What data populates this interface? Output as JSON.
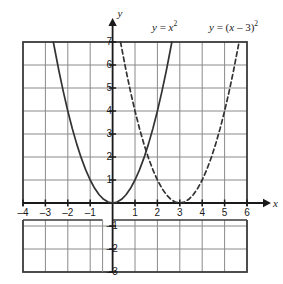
{
  "chart_data": {
    "type": "line",
    "title": "",
    "xlabel": "x",
    "ylabel": "y",
    "xlim": [
      -4,
      6
    ],
    "ylim": [
      -3,
      7
    ],
    "grid": true,
    "legend_position": "top",
    "x_ticks": [
      -4,
      -3,
      -2,
      -1,
      1,
      2,
      3,
      4,
      5,
      6
    ],
    "x_tick_labels": [
      "–4",
      "–3",
      "–2",
      "–1",
      "1",
      "2",
      "3",
      "4",
      "5",
      "6"
    ],
    "y_ticks": [
      7,
      6,
      5,
      4,
      3,
      2,
      1,
      -1,
      -2,
      -3
    ],
    "y_tick_labels": [
      "7",
      "6",
      "5",
      "4",
      "3",
      "2",
      "1",
      "–1",
      "–2",
      "–3"
    ],
    "series": [
      {
        "name": "y = x^2",
        "label_html": "<i>y</i> = <i>x</i><sup>2</sup>",
        "style": "solid",
        "color": "#333333",
        "vertex": [
          0,
          0
        ],
        "a": 1,
        "h": 0,
        "k": 0,
        "x": [
          -2.646,
          -2.4,
          -2.2,
          -2.0,
          -1.8,
          -1.6,
          -1.4,
          -1.2,
          -1.0,
          -0.8,
          -0.6,
          -0.4,
          -0.2,
          0,
          0.2,
          0.4,
          0.6,
          0.8,
          1.0,
          1.2,
          1.4,
          1.6,
          1.8,
          2.0,
          2.2,
          2.4,
          2.646
        ],
        "y": [
          7.0,
          5.76,
          4.84,
          4.0,
          3.24,
          2.56,
          1.96,
          1.44,
          1.0,
          0.64,
          0.36,
          0.16,
          0.04,
          0,
          0.04,
          0.16,
          0.36,
          0.64,
          1.0,
          1.44,
          1.96,
          2.56,
          3.24,
          4.0,
          4.84,
          5.76,
          7.0
        ]
      },
      {
        "name": "y = (x - 3)^2",
        "label_html": "<i>y</i> = (<i>x</i> – 3)<sup>2</sup>",
        "style": "dashed",
        "color": "#333333",
        "vertex": [
          3,
          0
        ],
        "a": 1,
        "h": 3,
        "k": 0,
        "x": [
          0.354,
          0.6,
          0.8,
          1.0,
          1.2,
          1.4,
          1.6,
          1.8,
          2.0,
          2.2,
          2.4,
          2.6,
          2.8,
          3.0,
          3.2,
          3.4,
          3.6,
          3.8,
          4.0,
          4.2,
          4.4,
          4.6,
          4.8,
          5.0,
          5.2,
          5.4,
          5.646
        ],
        "y": [
          7.0,
          5.76,
          4.84,
          4.0,
          3.24,
          2.56,
          1.96,
          1.44,
          1.0,
          0.64,
          0.36,
          0.16,
          0.04,
          0,
          0.04,
          0.16,
          0.36,
          0.64,
          1.0,
          1.44,
          1.96,
          2.56,
          3.24,
          4.0,
          4.84,
          5.76,
          7.0
        ]
      }
    ],
    "intersection": [
      1.5,
      2.25
    ],
    "annotations": []
  },
  "axes": {
    "x_axis_label": "x",
    "y_axis_label": "y"
  },
  "colors": {
    "grid": "#8a8a8a",
    "border": "#3a3a3a",
    "axis": "#1a1a1a",
    "curve": "#333333",
    "background": "#ffffff"
  },
  "labels": {
    "curve1_prefix": "y",
    "curve1_eq": "= ",
    "curve1_var": "x",
    "curve1_exp": "2",
    "curve2_prefix": "y",
    "curve2_eq": "= (",
    "curve2_var": "x",
    "curve2_mid": " – 3)",
    "curve2_exp": "2"
  }
}
